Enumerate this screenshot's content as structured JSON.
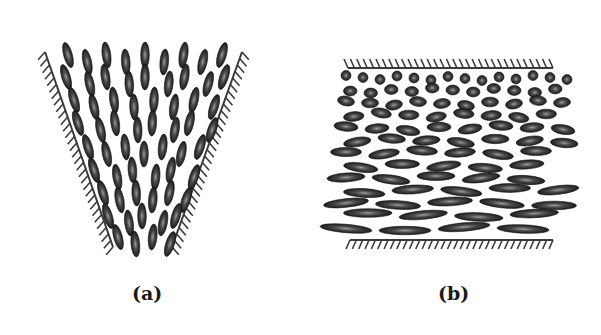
{
  "figure": {
    "panels": [
      {
        "id": "a",
        "label": "(a)",
        "description": "Liquid crystal molecules splaying between two converging hatched walls (funnel shape)",
        "walls": [
          "left-inclined-wall",
          "right-inclined-wall"
        ],
        "molecule_orientation": "elongated, aligned along local wall direction, fanning outward toward top"
      },
      {
        "id": "b",
        "label": "(b)",
        "description": "Liquid crystal molecules between two parallel horizontal hatched walls; near top wall they are short/round, becoming progressively elongated and horizontal toward bottom wall",
        "walls": [
          "top-horizontal-wall",
          "bottom-horizontal-wall"
        ],
        "molecule_orientation": "circular at top, elongated horizontal at bottom"
      }
    ],
    "colors": {
      "molecule": "#2a2a2a",
      "molecule_highlight": "#8a8a8a",
      "wall": "#3a3a3a",
      "background": "#ffffff"
    }
  }
}
